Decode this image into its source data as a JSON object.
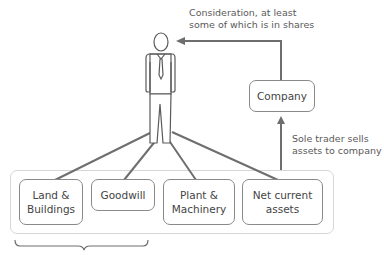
{
  "consideration": {
    "line1": "Consideration, at least",
    "line2": "some of which is in shares"
  },
  "company": {
    "label": "Company"
  },
  "sale_note": {
    "line1": "Sole trader sells",
    "line2": "assets to company"
  },
  "assets": [
    {
      "line1": "Land &",
      "line2": "Buildings"
    },
    {
      "line1": "Goodwill",
      "line2": ""
    },
    {
      "line1": "Plant &",
      "line2": "Machinery"
    },
    {
      "line1": "Net current",
      "line2": "assets"
    }
  ],
  "colors": {
    "line": "#6e6e6e",
    "box_border": "#8a8a8a",
    "container_border": "#d6d6d6",
    "text": "#4a4a4a"
  }
}
